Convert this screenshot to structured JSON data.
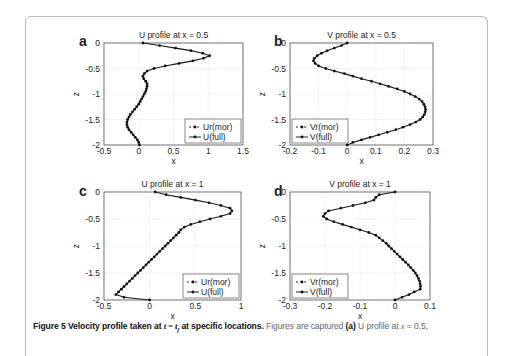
{
  "figure": {
    "caption_bold": "Figure 5 Velocity profile taken at ",
    "caption_math": "t = t",
    "caption_sub": "f",
    "caption_bold_end": " at specific locations.",
    "caption_rest": " Figures are captured ",
    "caption_a": "(a)",
    "caption_rest2": " U profile at ",
    "caption_x": "x",
    "caption_rest3": " = 0.5,"
  },
  "chart_data": [
    {
      "panel": "a",
      "type": "line",
      "title": "U profile at x = 0.5",
      "xlabel": "x",
      "ylabel": "z",
      "xlim": [
        -0.5,
        1.5
      ],
      "ylim": [
        -2,
        0
      ],
      "xticks": [
        "-0.5",
        "0",
        "0.5",
        "1",
        "1.5"
      ],
      "yticks": [
        "0",
        "-0.5",
        "-1",
        "-1.5",
        "-2"
      ],
      "grid": true,
      "legend": [
        "Ur(mor)",
        "U(full)"
      ],
      "legend_position": "lower right",
      "series": [
        {
          "name": "Ur(mor)",
          "style": "dashed-marker",
          "z": [
            0,
            -0.05,
            -0.1,
            -0.15,
            -0.2,
            -0.25,
            -0.3,
            -0.35,
            -0.4,
            -0.45,
            -0.5,
            -0.55,
            -0.6,
            -0.65,
            -0.7,
            -0.75,
            -0.8,
            -0.85,
            -0.9,
            -0.95,
            -1.0,
            -1.05,
            -1.1,
            -1.15,
            -1.2,
            -1.25,
            -1.3,
            -1.35,
            -1.4,
            -1.45,
            -1.5,
            -1.55,
            -1.6,
            -1.65,
            -1.7,
            -1.75,
            -1.8,
            -1.85,
            -1.9,
            -1.95,
            -2.0
          ],
          "x": [
            0.06,
            0.3,
            0.53,
            0.75,
            0.92,
            1.02,
            0.93,
            0.78,
            0.58,
            0.38,
            0.22,
            0.12,
            0.08,
            0.06,
            0.07,
            0.1,
            0.12,
            0.12,
            0.11,
            0.1,
            0.08,
            0.06,
            0.04,
            0.02,
            0.0,
            -0.03,
            -0.06,
            -0.09,
            -0.12,
            -0.14,
            -0.16,
            -0.17,
            -0.17,
            -0.16,
            -0.14,
            -0.11,
            -0.08,
            -0.05,
            -0.02,
            0.0,
            0.01
          ]
        },
        {
          "name": "U(full)",
          "style": "solid-marker",
          "same_as": "Ur(mor)"
        }
      ]
    },
    {
      "panel": "b",
      "type": "line",
      "title": "V profile at x = 0.5",
      "xlabel": "x",
      "ylabel": "z",
      "xlim": [
        -0.2,
        0.3
      ],
      "ylim": [
        -2,
        0
      ],
      "xticks": [
        "-0.2",
        "-0.1",
        "0",
        "0.1",
        "0.2",
        "0.3"
      ],
      "yticks": [
        "0",
        "-0.5",
        "-1",
        "-1.5",
        "-2"
      ],
      "grid": true,
      "legend": [
        "Vr(mor)",
        "V(full)"
      ],
      "legend_position": "lower left",
      "series": [
        {
          "name": "Vr(mor)",
          "style": "dashed-marker",
          "z": [
            0,
            -0.05,
            -0.1,
            -0.15,
            -0.2,
            -0.25,
            -0.3,
            -0.35,
            -0.4,
            -0.45,
            -0.5,
            -0.55,
            -0.6,
            -0.65,
            -0.7,
            -0.75,
            -0.8,
            -0.85,
            -0.9,
            -0.95,
            -1.0,
            -1.05,
            -1.1,
            -1.15,
            -1.2,
            -1.25,
            -1.3,
            -1.35,
            -1.4,
            -1.45,
            -1.5,
            -1.55,
            -1.6,
            -1.65,
            -1.7,
            -1.75,
            -1.8,
            -1.85,
            -1.9,
            -1.95,
            -2.0
          ],
          "x": [
            0.0,
            -0.02,
            -0.045,
            -0.07,
            -0.09,
            -0.105,
            -0.115,
            -0.118,
            -0.112,
            -0.1,
            -0.075,
            -0.045,
            -0.01,
            0.02,
            0.05,
            0.085,
            0.115,
            0.145,
            0.175,
            0.2,
            0.22,
            0.238,
            0.252,
            0.262,
            0.268,
            0.272,
            0.274,
            0.273,
            0.27,
            0.264,
            0.255,
            0.24,
            0.22,
            0.195,
            0.17,
            0.14,
            0.11,
            0.08,
            0.05,
            0.02,
            0.0
          ]
        },
        {
          "name": "V(full)",
          "style": "solid-marker",
          "same_as": "Vr(mor)"
        }
      ]
    },
    {
      "panel": "c",
      "type": "line",
      "title": "U profile at x = 1",
      "xlabel": "x",
      "ylabel": "z",
      "xlim": [
        -0.5,
        1
      ],
      "ylim": [
        -2,
        0
      ],
      "xticks": [
        "-0.5",
        "0",
        "0.5",
        "1"
      ],
      "yticks": [
        "0",
        "-0.5",
        "-1",
        "-1.5",
        "-2"
      ],
      "grid": true,
      "legend": [
        "Ur(mor)",
        "U(full)"
      ],
      "legend_position": "lower right",
      "series": [
        {
          "name": "Ur(mor)",
          "style": "dashed-marker",
          "z": [
            0,
            -0.05,
            -0.1,
            -0.15,
            -0.2,
            -0.25,
            -0.3,
            -0.35,
            -0.4,
            -0.45,
            -0.5,
            -0.55,
            -0.6,
            -0.65,
            -0.7,
            -0.75,
            -0.8,
            -0.85,
            -0.9,
            -0.95,
            -1.0,
            -1.05,
            -1.1,
            -1.15,
            -1.2,
            -1.25,
            -1.3,
            -1.35,
            -1.4,
            -1.45,
            -1.5,
            -1.55,
            -1.6,
            -1.65,
            -1.7,
            -1.75,
            -1.8,
            -1.85,
            -1.9,
            -1.95,
            -2.0
          ],
          "x": [
            0.06,
            0.18,
            0.34,
            0.5,
            0.65,
            0.78,
            0.88,
            0.9,
            0.88,
            0.78,
            0.66,
            0.55,
            0.45,
            0.38,
            0.34,
            0.32,
            0.29,
            0.26,
            0.23,
            0.2,
            0.17,
            0.14,
            0.11,
            0.08,
            0.05,
            0.02,
            -0.01,
            -0.04,
            -0.07,
            -0.1,
            -0.13,
            -0.16,
            -0.19,
            -0.22,
            -0.25,
            -0.28,
            -0.31,
            -0.34,
            -0.37,
            -0.28,
            0.0
          ]
        },
        {
          "name": "U(full)",
          "style": "solid-marker",
          "same_as": "Ur(mor)"
        }
      ]
    },
    {
      "panel": "d",
      "type": "line",
      "title": "V profile at x = 1",
      "xlabel": "x",
      "ylabel": "z",
      "xlim": [
        -0.3,
        0.1
      ],
      "ylim": [
        -2,
        0
      ],
      "xticks": [
        "-0.3",
        "-0.2",
        "-0.1",
        "0",
        "0.1"
      ],
      "yticks": [
        "0",
        "-0.5",
        "-1",
        "-1.5",
        "-2"
      ],
      "grid": true,
      "legend": [
        "Vr(mor)",
        "V(full)"
      ],
      "legend_position": "lower left",
      "series": [
        {
          "name": "Vr(mor)",
          "style": "dashed-marker",
          "z": [
            0,
            -0.05,
            -0.1,
            -0.15,
            -0.2,
            -0.25,
            -0.3,
            -0.35,
            -0.4,
            -0.45,
            -0.5,
            -0.55,
            -0.6,
            -0.65,
            -0.7,
            -0.75,
            -0.8,
            -0.85,
            -0.9,
            -0.95,
            -1.0,
            -1.05,
            -1.1,
            -1.15,
            -1.2,
            -1.25,
            -1.3,
            -1.35,
            -1.4,
            -1.45,
            -1.5,
            -1.55,
            -1.6,
            -1.65,
            -1.7,
            -1.75,
            -1.8,
            -1.85,
            -1.9,
            -1.95,
            -2.0
          ],
          "x": [
            0.0,
            -0.045,
            -0.055,
            -0.06,
            -0.085,
            -0.12,
            -0.155,
            -0.19,
            -0.2,
            -0.205,
            -0.195,
            -0.175,
            -0.15,
            -0.125,
            -0.1,
            -0.075,
            -0.055,
            -0.045,
            -0.035,
            -0.025,
            -0.018,
            -0.01,
            -0.002,
            0.006,
            0.014,
            0.022,
            0.03,
            0.038,
            0.045,
            0.052,
            0.058,
            0.063,
            0.067,
            0.07,
            0.072,
            0.073,
            0.072,
            0.055,
            0.04,
            0.02,
            0.0
          ]
        },
        {
          "name": "V(full)",
          "style": "solid-marker",
          "same_as": "Vr(mor)"
        }
      ]
    }
  ]
}
